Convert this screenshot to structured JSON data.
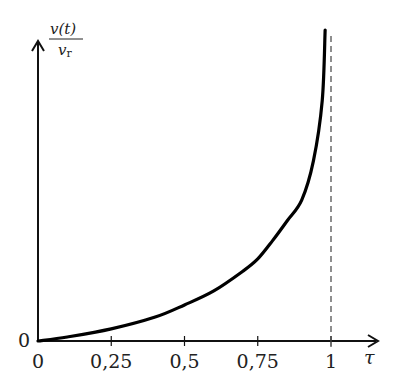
{
  "chart_data": {
    "type": "line",
    "title": "",
    "xlabel": "τ",
    "ylabel_numerator": "v(t)",
    "ylabel_denominator": "v_r",
    "ylabel": "v(t)/v_r",
    "x_ticks": [
      "0",
      "0,25",
      "0,5",
      "0,75",
      "1"
    ],
    "x_tick_values": [
      0,
      0.25,
      0.5,
      0.75,
      1
    ],
    "y_ticks": [
      "0"
    ],
    "xlim": [
      0,
      1.15
    ],
    "ylim": [
      0,
      1.05
    ],
    "asymptote": {
      "x": 1,
      "style": "dashed"
    },
    "grid": false,
    "series": [
      {
        "name": "v(t)/v_r",
        "x": [
          0,
          0.1,
          0.25,
          0.4,
          0.5,
          0.6,
          0.7,
          0.75,
          0.8,
          0.85,
          0.9,
          0.94,
          0.97,
          0.98
        ],
        "y": [
          0,
          0.013,
          0.039,
          0.077,
          0.116,
          0.161,
          0.225,
          0.264,
          0.322,
          0.386,
          0.453,
          0.579,
          0.772,
          1.0
        ]
      }
    ]
  },
  "labels": {
    "x_axis": "τ",
    "y_axis_num": "v(t)",
    "y_axis_den": "r",
    "y_axis_den_v": "v",
    "origin_y": "0",
    "ticks": [
      "0",
      "0,25",
      "0,5",
      "0,75",
      "1"
    ]
  }
}
